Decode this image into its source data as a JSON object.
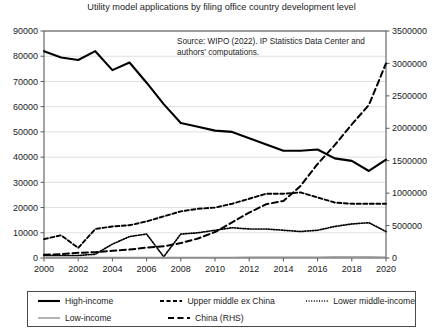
{
  "title": "Utility model applications by filing office country development level",
  "source_note": "Source: WIPO (2022). IP Statistics Data Center and authors' computations.",
  "axis": {
    "left_ticks": [
      "0",
      "10000",
      "20000",
      "30000",
      "40000",
      "50000",
      "60000",
      "70000",
      "80000",
      "90000"
    ],
    "right_ticks": [
      "0",
      "500000",
      "1000000",
      "1500000",
      "2000000",
      "2500000",
      "3000000",
      "3500000"
    ],
    "x_ticks": [
      "2000",
      "2002",
      "2004",
      "2006",
      "2008",
      "2010",
      "2012",
      "2014",
      "2016",
      "2018",
      "2020"
    ]
  },
  "legend": {
    "items": [
      {
        "label": "High-income",
        "style": "solid",
        "color": "#000000",
        "width": 2.1
      },
      {
        "label": "Upper middle ex China",
        "style": "dashed",
        "color": "#000000",
        "width": 1.9
      },
      {
        "label": "Lower middle-income",
        "style": "dotted",
        "color": "#000000",
        "width": 1.7
      },
      {
        "label": "Low-income",
        "style": "solid",
        "color": "#8c8c8c",
        "width": 1.3
      },
      {
        "label": "China (RHS)",
        "style": "longdash",
        "color": "#000000",
        "width": 2.0
      }
    ]
  },
  "chart_data": {
    "type": "line",
    "title": "Utility model applications by filing office country development level",
    "xlabel": "",
    "ylabel": "",
    "grid": true,
    "legend_position": "bottom",
    "x": [
      2000,
      2001,
      2002,
      2003,
      2004,
      2005,
      2006,
      2007,
      2008,
      2009,
      2010,
      2011,
      2012,
      2013,
      2014,
      2015,
      2016,
      2017,
      2018,
      2019,
      2020
    ],
    "ylim_left": [
      0,
      90000
    ],
    "ylim_right": [
      0,
      3500000
    ],
    "series": [
      {
        "name": "High-income",
        "axis": "left",
        "style": "solid",
        "color": "#000000",
        "values": [
          82000,
          79500,
          78500,
          82000,
          74500,
          77500,
          69500,
          61000,
          53500,
          52000,
          50500,
          50000,
          47500,
          45000,
          42500,
          42500,
          43000,
          39500,
          38500,
          34500,
          39000
        ]
      },
      {
        "name": "Upper middle ex China",
        "axis": "left",
        "style": "dashed",
        "color": "#000000",
        "values": [
          7500,
          9000,
          4000,
          11500,
          12500,
          13000,
          14500,
          16500,
          18500,
          19500,
          20000,
          21500,
          23500,
          25500,
          25500,
          26000,
          24000,
          22000,
          21500,
          21500,
          21500
        ]
      },
      {
        "name": "Lower middle-income",
        "axis": "left",
        "style": "dotted",
        "color": "#000000",
        "values": [
          1000,
          1000,
          1000,
          1500,
          5500,
          8500,
          9500,
          500,
          9500,
          10000,
          11000,
          12000,
          11500,
          11500,
          11000,
          10500,
          11000,
          12500,
          13500,
          14000,
          10500
        ]
      },
      {
        "name": "Low-income",
        "axis": "left",
        "style": "solid",
        "color": "#8c8c8c",
        "values": [
          200,
          200,
          200,
          200,
          200,
          200,
          200,
          200,
          250,
          250,
          250,
          250,
          300,
          300,
          300,
          300,
          350,
          400,
          450,
          400,
          350
        ]
      },
      {
        "name": "China (RHS)",
        "axis": "right",
        "style": "longdash",
        "color": "#000000",
        "values": [
          50000,
          60000,
          80000,
          90000,
          110000,
          130000,
          160000,
          180000,
          230000,
          300000,
          400000,
          550000,
          700000,
          830000,
          880000,
          1110000,
          1450000,
          1740000,
          2060000,
          2360000,
          3000000
        ]
      }
    ]
  }
}
